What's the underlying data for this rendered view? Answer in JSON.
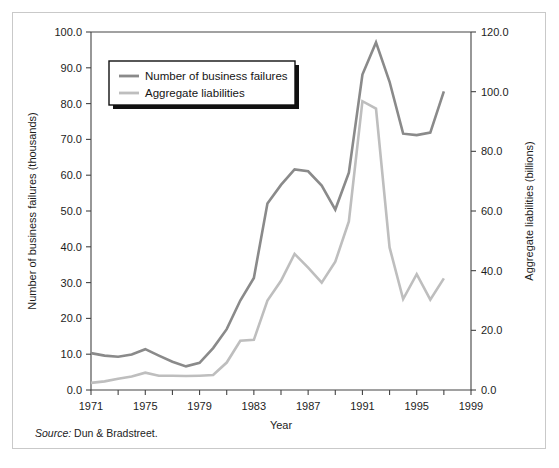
{
  "figure": {
    "source_label": "Source:",
    "source_text": "Dun & Bradstreet."
  },
  "chart_data": {
    "type": "line",
    "title": "",
    "xlabel": "Year",
    "ylabel": "Number of business failures (thousands)",
    "y2label": "Aggregate liabilities (billions)",
    "xlim": [
      1971,
      1999
    ],
    "ylim": [
      0,
      100
    ],
    "y2lim": [
      0,
      120
    ],
    "xticks": [
      1971,
      1973,
      1975,
      1977,
      1979,
      1981,
      1983,
      1985,
      1987,
      1989,
      1991,
      1993,
      1995,
      1997,
      1999
    ],
    "xticklabels": [
      "1971",
      "",
      "1975",
      "",
      "1979",
      "",
      "1983",
      "",
      "1987",
      "",
      "1991",
      "",
      "1995",
      "",
      "1999"
    ],
    "yticks": [
      0,
      10,
      20,
      30,
      40,
      50,
      60,
      70,
      80,
      90,
      100
    ],
    "yticklabels": [
      "0.0",
      "10.0",
      "20.0",
      "30.0",
      "40.0",
      "50.0",
      "60.0",
      "70.0",
      "80.0",
      "90.0",
      "100.0"
    ],
    "y2ticks": [
      0,
      20,
      40,
      60,
      80,
      100,
      120
    ],
    "y2ticklabels": [
      "0.0",
      "20.0",
      "40.0",
      "60.0",
      "80.0",
      "100.0",
      "120.0"
    ],
    "grid": false,
    "legend_position": "upper-left",
    "series": [
      {
        "name": "Number of business failures",
        "axis": "left",
        "color": "#8a8a8a",
        "x": [
          1971,
          1972,
          1973,
          1974,
          1975,
          1976,
          1977,
          1978,
          1979,
          1980,
          1981,
          1982,
          1983,
          1984,
          1985,
          1986,
          1987,
          1988,
          1989,
          1990,
          1991,
          1992,
          1993,
          1994,
          1995,
          1996,
          1997
        ],
        "values": [
          10.3,
          9.6,
          9.3,
          9.9,
          11.4,
          9.6,
          7.9,
          6.6,
          7.6,
          11.7,
          17.0,
          25.0,
          31.3,
          52.1,
          57.3,
          61.6,
          61.1,
          57.1,
          50.4,
          60.7,
          88.1,
          97.1,
          86.1,
          71.6,
          71.2,
          71.9,
          83.4
        ]
      },
      {
        "name": "Aggregate liabilities",
        "axis": "right",
        "color": "#bebebe",
        "x": [
          1971,
          1972,
          1973,
          1974,
          1975,
          1976,
          1977,
          1978,
          1979,
          1980,
          1981,
          1982,
          1983,
          1984,
          1985,
          1986,
          1987,
          1988,
          1989,
          1990,
          1991,
          1992,
          1993,
          1994,
          1995,
          1996,
          1997
        ],
        "values": [
          2.4,
          2.9,
          3.8,
          4.5,
          5.8,
          4.8,
          4.8,
          4.7,
          4.8,
          5.0,
          9.2,
          16.5,
          16.8,
          30.0,
          36.6,
          45.6,
          41.0,
          36.0,
          43.0,
          56.5,
          96.8,
          94.3,
          47.8,
          30.5,
          38.8,
          30.3,
          37.4
        ]
      }
    ]
  }
}
